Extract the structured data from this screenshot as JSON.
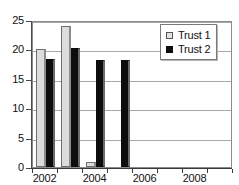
{
  "chart_data": {
    "type": "bar",
    "title": "",
    "subtitle": "",
    "xlabel": "",
    "ylabel": "",
    "categories": [
      "2002",
      "2003",
      "2004",
      "2005",
      "2006",
      "2007",
      "2008",
      "2009"
    ],
    "series": [
      {
        "name": "Trust 1",
        "color": "#dcdcdc",
        "values": [
          20.0,
          24.0,
          0.8,
          0.0,
          0.0,
          0.0,
          0.0,
          0.0
        ]
      },
      {
        "name": "Trust 2",
        "color": "#0d0d0d",
        "values": [
          18.3,
          20.2,
          18.2,
          18.2,
          0.0,
          0.0,
          0.0,
          0.0
        ]
      }
    ],
    "ylim": [
      0,
      25
    ],
    "yticks": [
      0,
      5,
      10,
      15,
      20,
      25
    ],
    "ytick_labels": [
      "0",
      "5",
      "10",
      "15",
      "20",
      "25"
    ],
    "xtick_labels": [
      "2002",
      "2004",
      "2006",
      "2008"
    ],
    "xtick_categories": [
      "2002",
      "2004",
      "2006",
      "2008"
    ],
    "grid": true,
    "grid_axis": "y",
    "legend_position": "top-right",
    "legend_entries": [
      "Trust 1",
      "Trust 2"
    ]
  },
  "legend": {
    "items": [
      {
        "label": "Trust 1",
        "swatch": "light-square-swatch"
      },
      {
        "label": "Trust 2",
        "swatch": "dark-square-swatch"
      }
    ]
  },
  "axes": {
    "y_labels": [
      "25",
      "20",
      "15",
      "10",
      "5",
      "0"
    ],
    "x_labels": [
      "2002",
      "2004",
      "2006",
      "2008"
    ]
  }
}
